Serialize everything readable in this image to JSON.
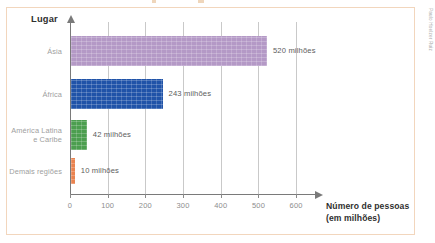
{
  "figure": {
    "credit": "Paulo Hoelzer Ruiz",
    "border_color": "#f2d6bd"
  },
  "axes": {
    "y_title": "Lugar",
    "x_title_line1": "Número de pessoas",
    "x_title_line2": "(em milhões)"
  },
  "chart_data": {
    "type": "bar",
    "orientation": "horizontal",
    "title": "",
    "xlabel": "Número de pessoas (em milhões)",
    "ylabel": "Lugar",
    "xlim": [
      0,
      650
    ],
    "xticks": [
      0,
      100,
      200,
      300,
      400,
      500,
      600
    ],
    "xtick_labels": [
      "0",
      "100",
      "200",
      "300",
      "400",
      "500",
      "600"
    ],
    "grid": "vertical",
    "legend": "none",
    "categories": [
      "Ásia",
      "África",
      "América Latina\ne Caribe",
      "Demais regiões"
    ],
    "values": [
      520,
      243,
      42,
      10
    ],
    "data_labels": [
      "520 milhões",
      "243 milhões",
      "42 milhões",
      "10 milhões"
    ],
    "colors": [
      "#b499c6",
      "#2053a8",
      "#4c9e4f",
      "#e98350"
    ]
  }
}
